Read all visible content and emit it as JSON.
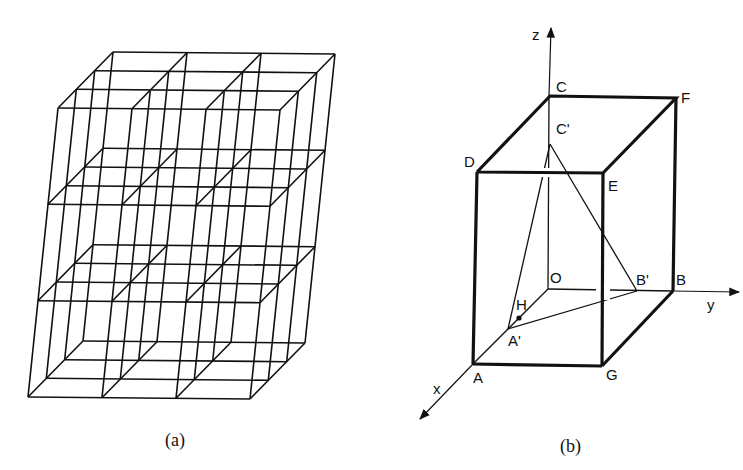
{
  "figure_a": {
    "caption": "(a)",
    "description": "3x3x3 cubic lattice wireframe in oblique projection",
    "grid": {
      "nx": 3,
      "ny": 3,
      "nz": 3
    }
  },
  "figure_b": {
    "caption": "(b)",
    "axes": {
      "x": "x",
      "y": "y",
      "z": "z"
    },
    "points": {
      "O": "O",
      "A": "A",
      "B": "B",
      "C": "C",
      "D": "D",
      "E": "E",
      "F": "F",
      "G": "G",
      "A_prime": "A'",
      "B_prime": "B'",
      "C_prime": "C'",
      "H": "H"
    }
  },
  "colors": {
    "ink": "#111111",
    "background": "#ffffff"
  }
}
